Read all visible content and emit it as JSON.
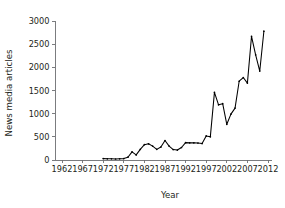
{
  "chart_data": {
    "type": "line",
    "title": "",
    "xlabel": "Year",
    "ylabel": "News media articles",
    "xlim": [
      1962,
      2012
    ],
    "ylim": [
      0,
      3000
    ],
    "grid": false,
    "legend": null,
    "x_ticks": [
      1962,
      1967,
      1972,
      1977,
      1982,
      1987,
      1992,
      1997,
      2002,
      2007,
      2012
    ],
    "x_tick_labels": [
      "1962",
      "1967",
      "1972",
      "1977",
      "1982",
      "1987",
      "1992",
      "1997",
      "2002",
      "2007",
      "2012"
    ],
    "y_ticks": [
      0,
      500,
      1000,
      1500,
      2000,
      2500,
      3000
    ],
    "y_tick_labels": [
      "0",
      "500",
      "1000",
      "1500",
      "2000",
      "2500",
      "3000"
    ],
    "line_color": "#000000",
    "marker": "dot",
    "x": [
      1972,
      1973,
      1974,
      1975,
      1976,
      1977,
      1978,
      1979,
      1980,
      1981,
      1982,
      1983,
      1984,
      1985,
      1986,
      1987,
      1988,
      1989,
      1990,
      1991,
      1992,
      1993,
      1994,
      1995,
      1996,
      1997,
      1998,
      1999,
      2000,
      2001,
      2002,
      2003,
      2004,
      2005,
      2006,
      2007,
      2008,
      2009,
      2010,
      2011
    ],
    "values": [
      30,
      25,
      25,
      22,
      25,
      30,
      60,
      175,
      110,
      230,
      330,
      350,
      300,
      230,
      280,
      420,
      300,
      225,
      215,
      270,
      375,
      370,
      370,
      365,
      355,
      520,
      500,
      1460,
      1190,
      1215,
      770,
      990,
      1120,
      1700,
      1780,
      1660,
      2670,
      2270,
      1920,
      2780
    ],
    "series": [
      {
        "name": "News media articles",
        "color": "#000000",
        "points": [
          {
            "year": 1972,
            "value": 30
          },
          {
            "year": 1973,
            "value": 25
          },
          {
            "year": 1974,
            "value": 25
          },
          {
            "year": 1975,
            "value": 22
          },
          {
            "year": 1976,
            "value": 25
          },
          {
            "year": 1977,
            "value": 30
          },
          {
            "year": 1978,
            "value": 60
          },
          {
            "year": 1979,
            "value": 175
          },
          {
            "year": 1980,
            "value": 110
          },
          {
            "year": 1981,
            "value": 230
          },
          {
            "year": 1982,
            "value": 330
          },
          {
            "year": 1983,
            "value": 350
          },
          {
            "year": 1984,
            "value": 300
          },
          {
            "year": 1985,
            "value": 230
          },
          {
            "year": 1986,
            "value": 280
          },
          {
            "year": 1987,
            "value": 420
          },
          {
            "year": 1988,
            "value": 300
          },
          {
            "year": 1989,
            "value": 225
          },
          {
            "year": 1990,
            "value": 215
          },
          {
            "year": 1991,
            "value": 270
          },
          {
            "year": 1992,
            "value": 375
          },
          {
            "year": 1993,
            "value": 370
          },
          {
            "year": 1994,
            "value": 370
          },
          {
            "year": 1995,
            "value": 365
          },
          {
            "year": 1996,
            "value": 355
          },
          {
            "year": 1997,
            "value": 520
          },
          {
            "year": 1998,
            "value": 500
          },
          {
            "year": 1999,
            "value": 1460
          },
          {
            "year": 2000,
            "value": 1190
          },
          {
            "year": 2001,
            "value": 1215
          },
          {
            "year": 2002,
            "value": 770
          },
          {
            "year": 2003,
            "value": 990
          },
          {
            "year": 2004,
            "value": 1120
          },
          {
            "year": 2005,
            "value": 1700
          },
          {
            "year": 2006,
            "value": 1780
          },
          {
            "year": 2007,
            "value": 1660
          },
          {
            "year": 2008,
            "value": 2670
          },
          {
            "year": 2009,
            "value": 2270
          },
          {
            "year": 2010,
            "value": 1920
          },
          {
            "year": 2011,
            "value": 2780
          }
        ]
      }
    ]
  }
}
